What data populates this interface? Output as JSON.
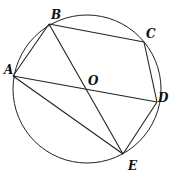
{
  "diagram": {
    "circle": {
      "cx": 87,
      "cy": 89,
      "r": 74
    },
    "points": {
      "A": {
        "x": 13,
        "y": 76,
        "label": "A",
        "lx": 4,
        "ly": 74
      },
      "B": {
        "x": 49,
        "y": 24,
        "label": "B",
        "lx": 52,
        "ly": 18
      },
      "C": {
        "x": 144,
        "y": 42,
        "label": "C",
        "lx": 147,
        "ly": 38
      },
      "D": {
        "x": 157,
        "y": 102,
        "label": "D",
        "lx": 158,
        "ly": 101
      },
      "E": {
        "x": 123,
        "y": 154,
        "label": "E",
        "lx": 128,
        "ly": 170
      },
      "O": {
        "x": 87,
        "y": 89,
        "label": "O",
        "lx": 88,
        "ly": 85
      }
    },
    "segments": [
      [
        "A",
        "B"
      ],
      [
        "B",
        "C"
      ],
      [
        "C",
        "D"
      ],
      [
        "D",
        "E"
      ],
      [
        "A",
        "E"
      ],
      [
        "A",
        "D"
      ],
      [
        "B",
        "E"
      ]
    ]
  }
}
